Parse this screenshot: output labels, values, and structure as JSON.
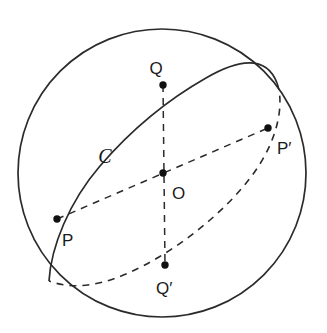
{
  "figure": {
    "name": "sphere-great-circle-diagram",
    "background_color": "#ffffff",
    "stroke_color": "#2b2b2b",
    "point_color": "#111111",
    "sphere": {
      "label": "sphere-outline",
      "center": {
        "x": 162,
        "y": 173
      },
      "radius": 144,
      "stroke_width": 1.6,
      "style": "solid"
    },
    "great_circle": {
      "name": "C",
      "label_text": "C",
      "label_position": {
        "x": 105,
        "y": 163
      },
      "center": {
        "x": 163,
        "y": 173
      },
      "semi_major": 144,
      "semi_minor": 57,
      "rotation_deg": -38,
      "front_arc_style": "solid",
      "back_arc_style": "dashed",
      "dash_pattern": "7 6"
    },
    "points": [
      {
        "id": "Q",
        "label": "Q",
        "x": 163,
        "y": 85,
        "label_x": 156,
        "label_y": 72,
        "radius": 3.6
      },
      {
        "id": "P'",
        "label": "P′",
        "x": 268,
        "y": 128,
        "label_x": 277,
        "label_y": 148,
        "radius": 3.6
      },
      {
        "id": "O",
        "label": "O",
        "x": 163,
        "y": 173,
        "label_x": 171,
        "label_y": 196,
        "radius": 3.6
      },
      {
        "id": "P",
        "label": "P",
        "x": 57,
        "y": 219,
        "label_x": 61,
        "label_y": 243,
        "radius": 3.6
      },
      {
        "id": "Q'",
        "label": "Q′",
        "x": 165,
        "y": 265,
        "label_x": 155,
        "label_y": 292,
        "radius": 3.6
      }
    ],
    "diameters": [
      {
        "id": "PP-prime",
        "from": "P",
        "to": "P'",
        "style": "dashed",
        "dash_pattern": "7 6"
      },
      {
        "id": "QQ-prime",
        "from": "Q",
        "to": "Q'",
        "style": "dashed",
        "dash_pattern": "7 6"
      }
    ],
    "paths": {
      "sphere_circle": "M 18,173 A 144,144 0 1,1 306,173 A 144,144 0 1,1 18,173",
      "great_circle_front": "M 49,281 C 52,248 70,203 101,167 C 132,131 170,100 207,79 C 238,61 266,55 277,83",
      "great_circle_back": "M 277,83 C 284,101 280,134 259,166 C 238,198 200,232 160,256 C 120,280 82,292 49,281",
      "diameter_pp": "M 57,219 L 268,128",
      "diameter_qq": "M 163,85 L 165,265"
    }
  }
}
